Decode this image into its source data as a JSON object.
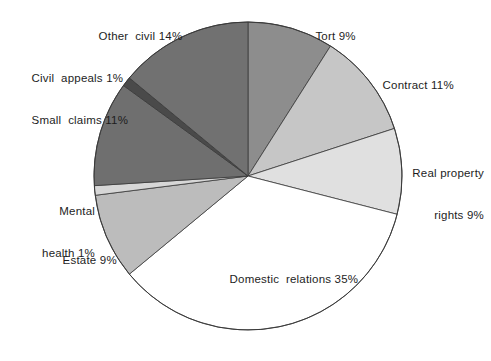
{
  "chart_data": {
    "type": "pie",
    "title": "",
    "subtitle": "",
    "xlabel": "",
    "ylabel": "",
    "legend_position": "none",
    "grid": false,
    "units": "percent",
    "start_angle_deg": 0,
    "direction": "clockwise",
    "categories": [
      "Tort",
      "Contract",
      "Real property rights",
      "Domestic relations",
      "Estate",
      "Mental health",
      "Small claims",
      "Civil appeals",
      "Other civil"
    ],
    "values": [
      9,
      11,
      9,
      35,
      9,
      1,
      11,
      1,
      14
    ],
    "slices": [
      {
        "name": "Tort",
        "value": 9,
        "value_text": "9%",
        "label": "Tort 9%",
        "color": "#8d8d8d",
        "label_lines": [
          "Tort 9%"
        ]
      },
      {
        "name": "Contract",
        "value": 11,
        "value_text": "11%",
        "label": "Contract 11%",
        "color": "#c6c6c6",
        "label_lines": [
          "Contract 11%"
        ]
      },
      {
        "name": "Real property rights",
        "value": 9,
        "value_text": "9%",
        "label": "Real property rights 9%",
        "color": "#e0e0e0",
        "label_lines": [
          "Real property",
          "rights 9%"
        ]
      },
      {
        "name": "Domestic relations",
        "value": 35,
        "value_text": "35%",
        "label": "Domestic relations 35%",
        "color": "#ffffff",
        "label_lines": [
          "Domestic  relations 35%"
        ]
      },
      {
        "name": "Estate",
        "value": 9,
        "value_text": "9%",
        "label": "Estate 9%",
        "color": "#bcbcbc",
        "label_lines": [
          "Estate 9%"
        ]
      },
      {
        "name": "Mental health",
        "value": 1,
        "value_text": "1%",
        "label": "Mental health 1%",
        "color": "#d7d7d7",
        "label_lines": [
          "Mental",
          "health 1%"
        ]
      },
      {
        "name": "Small claims",
        "value": 11,
        "value_text": "11%",
        "label": "Small claims 11%",
        "color": "#6f6f6f",
        "label_lines": [
          "Small  claims 11%"
        ]
      },
      {
        "name": "Civil appeals",
        "value": 1,
        "value_text": "1%",
        "label": "Civil appeals 1%",
        "color": "#4a4a4a",
        "label_lines": [
          "Civil  appeals 1%"
        ]
      },
      {
        "name": "Other civil",
        "value": 14,
        "value_text": "14%",
        "label": "Other civil 14%",
        "color": "#717171",
        "label_lines": [
          "Other  civil 14%"
        ]
      }
    ]
  },
  "labels": {
    "other_civil": "Other  civil 14%",
    "civil_appeals": "Civil  appeals 1%",
    "small_claims": "Small  claims 11%",
    "mental_health_line1": "Mental",
    "mental_health_line2": "health 1%",
    "estate": "Estate 9%",
    "domestic_relations": "Domestic  relations 35%",
    "real_property_line1": "Real property",
    "real_property_line2": "rights 9%",
    "contract": "Contract 11%",
    "tort": "Tort 9%"
  },
  "style": {
    "background": "#ffffff",
    "outline": "#3a3a3a",
    "text": "#1d1d1d"
  },
  "geometry": {
    "center_x": 248,
    "center_y": 176,
    "radius": 154
  }
}
